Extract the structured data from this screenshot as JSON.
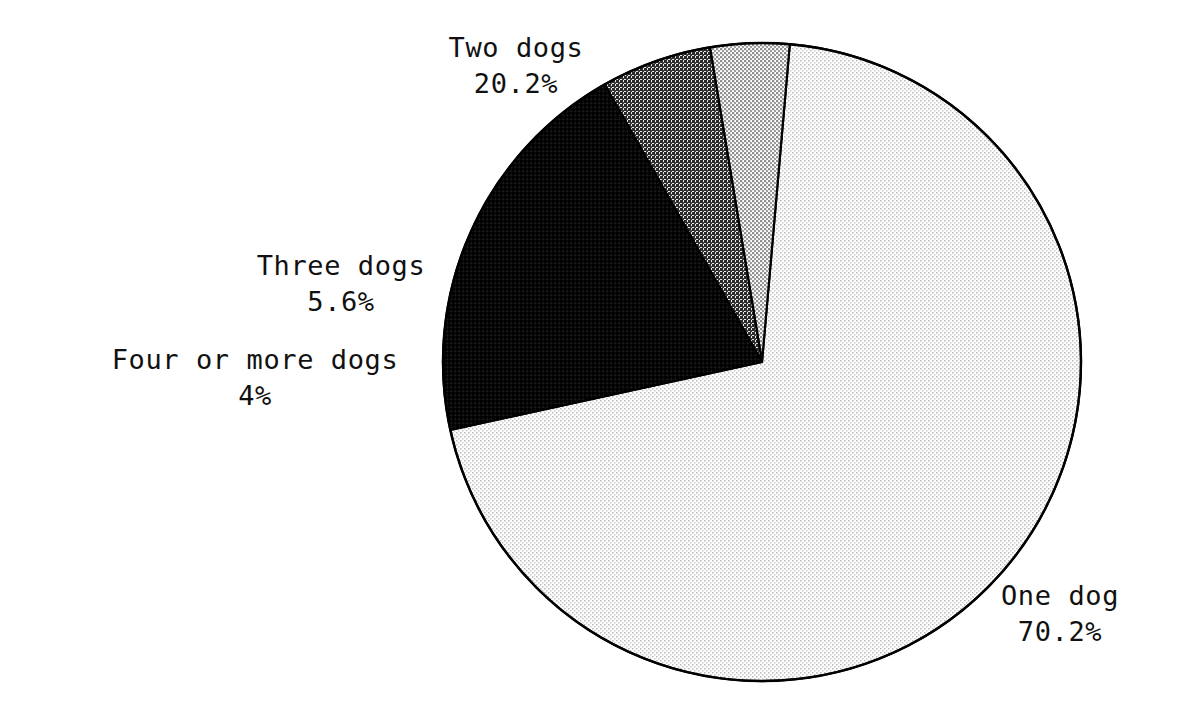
{
  "chart_data": {
    "type": "pie",
    "title": "",
    "subtitle": "",
    "xlabel": "",
    "ylabel": "",
    "grid": false,
    "legend_position": "none",
    "label_style": "outside-callout",
    "start_angle_deg": 5,
    "direction": "clockwise",
    "center_px": [
      762,
      362
    ],
    "radius_px": 319,
    "categories": [
      "One dog",
      "Two dogs",
      "Three dogs",
      "Four or more dogs"
    ],
    "values": [
      70.2,
      20.2,
      5.6,
      4.0
    ],
    "value_labels": [
      "70.2%",
      "20.2%",
      "5.6%",
      "4%"
    ],
    "slices": [
      {
        "label": "One dog",
        "value": 70.2,
        "value_label": "70.2%",
        "fill": "#ececec",
        "pattern": "fine-halftone-light",
        "stroke": "#000000"
      },
      {
        "label": "Two dogs",
        "value": 20.2,
        "value_label": "20.2%",
        "fill": "#0d0d0d",
        "pattern": "fine-halftone-black",
        "stroke": "#000000"
      },
      {
        "label": "Three dogs",
        "value": 5.6,
        "value_label": "5.6%",
        "fill": "#565656",
        "pattern": "fine-halftone-dark",
        "stroke": "#000000"
      },
      {
        "label": "Four or more dogs",
        "value": 4.0,
        "value_label": "4%",
        "fill": "#d2d2d2",
        "pattern": "fine-halftone-medium",
        "stroke": "#000000"
      }
    ]
  },
  "labels": {
    "one_dog": {
      "name": "One dog",
      "value": "70.2%"
    },
    "two_dogs": {
      "name": "Two dogs",
      "value": "20.2%"
    },
    "three_dogs": {
      "name": "Three dogs",
      "value": "5.6%"
    },
    "four_or_more_dogs": {
      "name": "Four or more dogs",
      "value": "4%"
    }
  },
  "colors": {
    "background": "#ffffff",
    "outline": "#000000",
    "text": "#111111"
  }
}
